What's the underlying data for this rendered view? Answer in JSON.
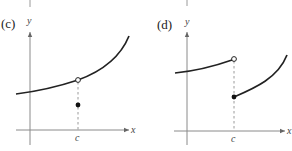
{
  "figure": {
    "panels": [
      {
        "id": "c",
        "label": "(c)",
        "x_axis_label": "x",
        "y_axis_label": "y",
        "c_label": "c",
        "description": "Continuous curve with removable discontinuity: open circle on curve at x=c, filled point below it"
      },
      {
        "id": "d",
        "label": "(d)",
        "x_axis_label": "x",
        "y_axis_label": "y",
        "c_label": "c",
        "description": "Jump discontinuity at x=c: left branch ends with open circle, right branch starts with filled point lower"
      }
    ]
  },
  "colors": {
    "curve": "#222222",
    "axis": "#8a8a8a",
    "dashed_line": "#9a9a9a"
  }
}
